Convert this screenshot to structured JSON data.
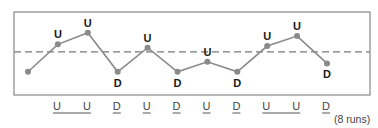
{
  "chart_data": {
    "type": "line",
    "title": "",
    "xlabel": "",
    "ylabel": "",
    "grid": false,
    "x": [
      1,
      2,
      3,
      4,
      5,
      6,
      7,
      8,
      9,
      10,
      11
    ],
    "values": [
      28,
      61,
      75,
      28,
      57,
      28,
      40,
      28,
      59,
      71,
      38
    ],
    "ylim": [
      0,
      100
    ],
    "reference_line": {
      "style": "dashed",
      "value": 52,
      "label": ""
    },
    "point_labels": [
      "",
      "U",
      "U",
      "D",
      "U",
      "D",
      "U",
      "D",
      "U",
      "U",
      "D"
    ],
    "run_sequence": [
      "U",
      "U",
      "D",
      "U",
      "D",
      "U",
      "D",
      "U",
      "U",
      "D"
    ],
    "runs": [
      {
        "letters": [
          "U",
          "U"
        ]
      },
      {
        "letters": [
          "D"
        ]
      },
      {
        "letters": [
          "U"
        ]
      },
      {
        "letters": [
          "D"
        ]
      },
      {
        "letters": [
          "U"
        ]
      },
      {
        "letters": [
          "D"
        ]
      },
      {
        "letters": [
          "U",
          "U"
        ]
      },
      {
        "letters": [
          "D"
        ]
      }
    ],
    "runs_count_label": "(8 runs)"
  },
  "colors": {
    "frame": "#888888",
    "line": "#8a8a8a",
    "point": "#8a8a8a",
    "dash": "#7a7a7a",
    "label": "#1a1a1a",
    "run_text": "#444444"
  }
}
